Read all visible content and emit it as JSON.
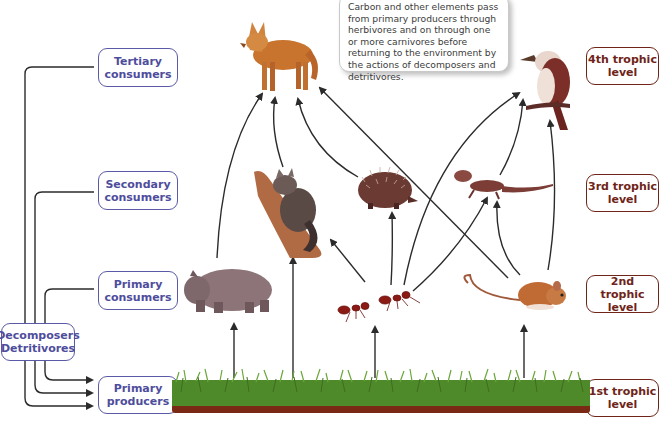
{
  "callout": {
    "text": "Carbon and other elements pass from primary producers through herbivores and on through one or more carnivores before returning to the environment by the actions of decomposers and detritivores."
  },
  "consumer_levels": [
    {
      "id": "tertiary",
      "label": "Tertiary consumers"
    },
    {
      "id": "secondary",
      "label": "Secondary consumers"
    },
    {
      "id": "primary",
      "label": "Primary consumers"
    },
    {
      "id": "producers",
      "label": "Primary producers"
    }
  ],
  "decomposers": {
    "line1": "Decomposers",
    "line2": "Detritivores"
  },
  "trophic_levels": [
    {
      "line1": "4th trophic",
      "line2": "level"
    },
    {
      "line1": "3rd trophic",
      "line2": "level"
    },
    {
      "line1": "2nd  trophic",
      "line2": "level"
    },
    {
      "line1": "1st trophic",
      "line2": "level"
    }
  ],
  "organisms": [
    {
      "name": "dingo",
      "level": "tertiary consumer"
    },
    {
      "name": "kookaburra",
      "level": "tertiary consumer"
    },
    {
      "name": "possum",
      "level": "secondary consumer"
    },
    {
      "name": "echidna",
      "level": "secondary consumer"
    },
    {
      "name": "lizard",
      "level": "secondary consumer"
    },
    {
      "name": "wombat",
      "level": "primary consumer"
    },
    {
      "name": "ants",
      "level": "primary consumer"
    },
    {
      "name": "mouse",
      "level": "primary consumer"
    },
    {
      "name": "grass",
      "level": "primary producer"
    }
  ],
  "colors": {
    "consumer_box": "#5b5aa6",
    "trophic_box": "#6e2418",
    "arrow": "#2b2b2b",
    "grass": "#4f8a2a",
    "soil": "#7a2a14"
  }
}
